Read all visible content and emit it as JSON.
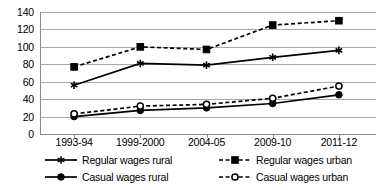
{
  "chart_data": {
    "type": "line",
    "title": "",
    "xlabel": "",
    "ylabel": "",
    "ylim": [
      0,
      140
    ],
    "ytick_step": 20,
    "grid": true,
    "legend_position": "bottom",
    "categories": [
      "1993-94",
      "1999-2000",
      "2004-05",
      "2009-10",
      "2011-12"
    ],
    "yticks": [
      "0",
      "20",
      "40",
      "60",
      "80",
      "100",
      "120",
      "140"
    ],
    "series": [
      {
        "name": "Regular wages rural",
        "values": [
          56,
          81,
          79,
          88,
          96
        ],
        "line_style": "solid",
        "marker": "star",
        "marker_fill": "#000000",
        "color": "#000000"
      },
      {
        "name": "Regular wages urban",
        "values": [
          77,
          100,
          97,
          125,
          130
        ],
        "line_style": "dashed",
        "marker": "square",
        "marker_fill": "#000000",
        "color": "#000000"
      },
      {
        "name": "Casual wages rural",
        "values": [
          20,
          27,
          30,
          35,
          45
        ],
        "line_style": "solid",
        "marker": "circle",
        "marker_fill": "#000000",
        "color": "#000000"
      },
      {
        "name": "Casual wages urban",
        "values": [
          23,
          32,
          34,
          41,
          55
        ],
        "line_style": "dashed",
        "marker": "circle-open",
        "marker_fill": "#ffffff",
        "color": "#000000"
      }
    ]
  }
}
